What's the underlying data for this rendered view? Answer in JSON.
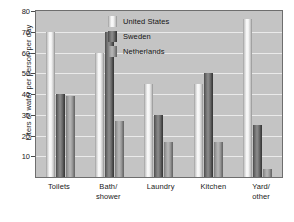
{
  "chart_data": {
    "type": "bar",
    "title": "",
    "subtitle": "",
    "xlabel": "",
    "ylabel": "Liters of water per person per day",
    "ylim": [
      0,
      80
    ],
    "yticks": [
      10,
      20,
      30,
      40,
      50,
      60,
      70,
      80
    ],
    "grid": true,
    "grid_axis": "y",
    "legend_position": "top-center-inside",
    "orientation": "vertical",
    "grouping": "grouped",
    "categories": [
      "Toilets",
      "Bath/\nshower",
      "Laundry",
      "Kitchen",
      "Yard/\nother"
    ],
    "category_labels_flat": [
      "Toilets",
      "Bath/shower",
      "Laundry",
      "Kitchen",
      "Yard/other"
    ],
    "series": [
      {
        "name": "United States",
        "color": "#f2f2f2",
        "values": [
          70,
          60,
          45,
          45,
          76
        ]
      },
      {
        "name": "Sweden",
        "color": "#5c5c5c",
        "values": [
          40,
          70,
          30,
          50,
          25
        ]
      },
      {
        "name": "Netherlands",
        "color": "#9a9a9a",
        "values": [
          39,
          27,
          17,
          17,
          4
        ]
      }
    ]
  },
  "figure": {
    "plot_background": "#c4c4c4",
    "page_background": "#ffffff",
    "frame_color": "#6e6e6e",
    "gridline_color": "#eaeaea",
    "text_color": "#1a1a1a"
  }
}
